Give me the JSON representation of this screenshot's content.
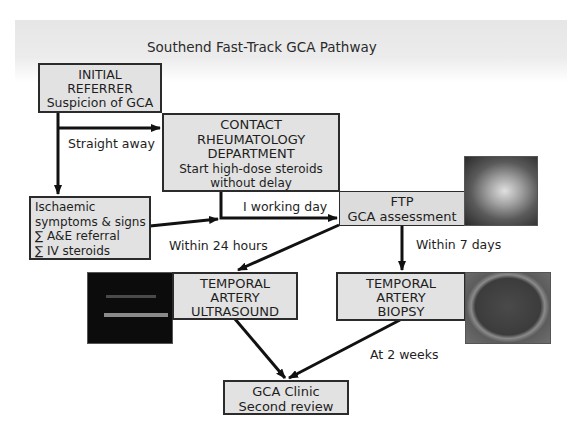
{
  "title": "Southend Fast-Track GCA Pathway",
  "nodes": {
    "initial_referrer": {
      "lines": [
        "INITIAL",
        "REFERRER",
        "Suspicion of GCA"
      ]
    },
    "contact_rheumatology": {
      "lines": [
        "CONTACT",
        "RHEUMATOLOGY",
        "DEPARTMENT",
        "Start high-dose steroids",
        "without delay"
      ]
    },
    "ischaemic": {
      "lines": [
        "Ischaemic",
        "symptoms & signs",
        "∑ A&E referral",
        "∑ IV steroids"
      ]
    },
    "ftp": {
      "lines": [
        "FTP",
        "GCA assessment"
      ]
    },
    "ultrasound": {
      "lines": [
        "TEMPORAL",
        "ARTERY",
        "ULTRASOUND"
      ]
    },
    "biopsy": {
      "lines": [
        "TEMPORAL",
        "ARTERY",
        "BIOPSY"
      ]
    },
    "clinic": {
      "lines": [
        "GCA Clinic",
        "Second review"
      ]
    }
  },
  "edge_labels": {
    "straight_away": "Straight away",
    "working_day": "I working day",
    "within_24h": "Within 24 hours",
    "within_7d": "Within 7 days",
    "at_2_weeks": "At 2 weeks"
  },
  "images": {
    "ftp_photo": "clinical-photo-temple",
    "ultrasound_photo": "ultrasound-scan",
    "biopsy_photo": "biopsy-specimen"
  },
  "colors": {
    "box_fill": "#e2e2e2",
    "box_border": "#2b2b2b",
    "arrow": "#111111",
    "band": "#e8e8e8"
  }
}
